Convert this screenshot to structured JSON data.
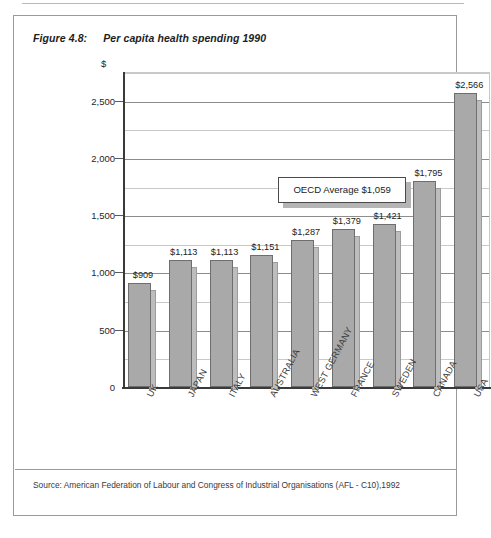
{
  "figure": {
    "number": "Figure 4.8:",
    "title": "Per capita health spending 1990"
  },
  "source": {
    "note": "Source: American Federation of Labour and Congress of Industrial Organisations (AFL - C10),1992"
  },
  "annotation": {
    "oecd_average_label": "OECD Average $1,059",
    "oecd_average_value": 1059
  },
  "axis": {
    "y_unit_symbol": "$",
    "y_ticks": [
      "0",
      "500",
      "1,000",
      "1,500",
      "2,000",
      "2,500"
    ],
    "y_min": 0,
    "y_max": 2750,
    "minor_step": 250
  },
  "chart_data": {
    "type": "bar",
    "title": "Per capita health spending 1990",
    "xlabel": "",
    "ylabel": "$",
    "ylim": [
      0,
      2750
    ],
    "grid": true,
    "legend": "none",
    "categories": [
      "UK",
      "JAPAN",
      "ITALY",
      "AUSTRALIA",
      "WEST GERMANY",
      "FRANCE",
      "SWEDEN",
      "CANADA",
      "USA"
    ],
    "values": [
      909,
      1113,
      1113,
      1151,
      1287,
      1379,
      1421,
      1795,
      2566
    ],
    "value_labels": [
      "$909",
      "$1,113",
      "$1,113",
      "$1,151",
      "$1,287",
      "$1,379",
      "$1,421",
      "$1,795",
      "$2,566"
    ],
    "annotations": [
      {
        "text": "OECD Average $1,059",
        "value": 1059
      }
    ],
    "bar_color": "#a9a9a9",
    "bar_border_color": "#6e6e6e",
    "shadow_color": "#bdbdbd"
  }
}
